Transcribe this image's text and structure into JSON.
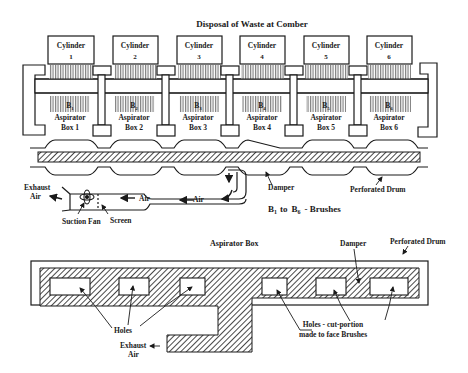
{
  "title": "Disposal of Waste at Comber",
  "cylinders": [
    {
      "label": "Cylinder",
      "num": "1"
    },
    {
      "label": "Cylinder",
      "num": "2"
    },
    {
      "label": "Cylinder",
      "num": "3"
    },
    {
      "label": "Cylinder",
      "num": "4"
    },
    {
      "label": "Cylinder",
      "num": "5"
    },
    {
      "label": "Cylinder",
      "num": "6"
    }
  ],
  "brushes": [
    {
      "letter": "B",
      "sub": "1"
    },
    {
      "letter": "B",
      "sub": "2"
    },
    {
      "letter": "B",
      "sub": "3"
    },
    {
      "letter": "B",
      "sub": "4"
    },
    {
      "letter": "B",
      "sub": "5"
    },
    {
      "letter": "B",
      "sub": "6"
    }
  ],
  "aspirator_boxes": [
    {
      "line1": "Aspirator",
      "line2": "Box 1"
    },
    {
      "line1": "Aspirator",
      "line2": "Box 2"
    },
    {
      "line1": "Aspirator",
      "line2": "Box 3"
    },
    {
      "line1": "Aspirator",
      "line2": "Box 4"
    },
    {
      "line1": "Aspirator",
      "line2": "Box 5"
    },
    {
      "line1": "Aspirator",
      "line2": "Box 6"
    }
  ],
  "top_labels": {
    "damper": "Damper",
    "perforated_drum": "Perforated Drum",
    "exhaust_air_line1": "Exhaust",
    "exhaust_air_line2": "Air",
    "air_1": "Air",
    "air_2": "Air",
    "suction_fan": "Suction Fan",
    "screen": "Screen",
    "brushes_legend_b": "B",
    "brushes_legend_sub1": "1",
    "brushes_legend_to": "to",
    "brushes_legend_b6": "B",
    "brushes_legend_sub6": "6",
    "brushes_legend_rest": "- Brushes"
  },
  "bottom_labels": {
    "aspirator_box": "Aspirator Box",
    "damper": "Damper",
    "perforated_drum": "Perforated Drum",
    "holes": "Holes",
    "holes_cut_line1": "Holes - cut-portion",
    "holes_cut_line2": "made to face Brushes",
    "exhaust_air_line1": "Exhaust",
    "exhaust_air_line2": "Air"
  },
  "colors": {
    "ink": "#1a1a1a",
    "brush_fill": "#8a8a8a",
    "background": "#ffffff"
  }
}
